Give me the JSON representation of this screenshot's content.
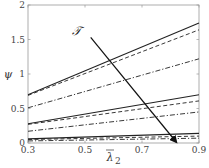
{
  "chart_data": {
    "type": "line",
    "title": "",
    "xlabel": "λ̄₂",
    "ylabel": "ψ",
    "xlim": [
      0.3,
      0.9
    ],
    "ylim": [
      0,
      2
    ],
    "xticks": [
      0.3,
      0.5,
      0.7,
      0.9
    ],
    "xtick_labels": [
      "0.3",
      "0.5",
      "0.7",
      "0.9"
    ],
    "yticks": [
      0,
      0.5,
      1,
      1.5,
      2
    ],
    "ytick_labels": [
      "0",
      "0.5",
      "1",
      "1.5",
      "2"
    ],
    "grid": false,
    "legend": null,
    "x": [
      0.3,
      0.9
    ],
    "series": [
      {
        "name": "group1-solid",
        "style": "solid",
        "values": [
          0.7,
          1.74
        ]
      },
      {
        "name": "group1-dashed",
        "style": "dashed",
        "values": [
          0.69,
          1.64
        ]
      },
      {
        "name": "group1-dashdot",
        "style": "dashdot",
        "values": [
          0.51,
          1.22
        ]
      },
      {
        "name": "group2-solid",
        "style": "solid",
        "values": [
          0.28,
          0.7
        ]
      },
      {
        "name": "group2-dashed",
        "style": "dashed",
        "values": [
          0.27,
          0.61
        ]
      },
      {
        "name": "group2-dashdot",
        "style": "dashdot",
        "values": [
          0.17,
          0.45
        ]
      },
      {
        "name": "group3-solid",
        "style": "solid",
        "values": [
          0.06,
          0.14
        ]
      },
      {
        "name": "group3-dashed",
        "style": "dashed",
        "values": [
          0.05,
          0.1
        ]
      },
      {
        "name": "group3-dashdot",
        "style": "dashdot",
        "values": [
          0.03,
          0.07
        ]
      }
    ],
    "annotations": [
      {
        "type": "text",
        "text": "𝒯",
        "x": 0.47,
        "y": 1.56
      },
      {
        "type": "arrow",
        "from": [
          0.52,
          1.53
        ],
        "to": [
          0.82,
          0.0
        ]
      }
    ]
  },
  "labels": {
    "xlabel_main": "λ",
    "xlabel_sub": "2",
    "ylabel": "ψ",
    "annotation": "𝒯"
  }
}
